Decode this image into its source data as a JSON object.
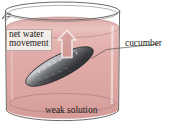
{
  "figure": {
    "type": "scientific-illustration",
    "labels": {
      "net_water_movement_line1": "net water",
      "net_water_movement_line2": "movement",
      "cucumber": "cucumber",
      "weak_solution": "weak solution"
    },
    "objects": {
      "beaker": "glass beaker with pour spout",
      "liquid": "pink weak solution",
      "cucumber": "dark grey-green cucumber submerged diagonally",
      "arrow": "upward block arrow indicating net water movement"
    },
    "colors": {
      "background": "#ffffff",
      "glass_outline": "#6d6a67",
      "liquid_top": "#e7b8b5",
      "liquid_body": "#e0a9a6",
      "liquid_deep": "#d59a98",
      "arrow_fill": "#d9a19f",
      "arrow_outline": "#ffffff",
      "cucumber_dark": "#3a3a3c",
      "cucumber_mid": "#6e7073",
      "cucumber_light": "#c9cbcd",
      "label_box_bg": "#f3ece9",
      "label_box_border": "#b9a9a4",
      "text": "#231c1a",
      "leader_line": "#5a5350"
    }
  }
}
